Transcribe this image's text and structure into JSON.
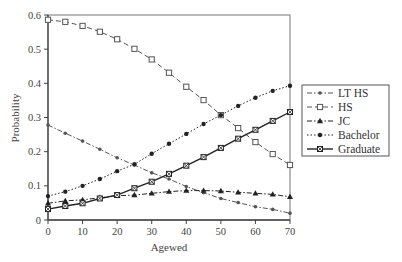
{
  "chart_data": {
    "type": "line",
    "title": "",
    "xlabel": "Agewed",
    "ylabel": "Probability",
    "xlim": [
      0,
      70
    ],
    "ylim": [
      0,
      0.6
    ],
    "xticks": [
      0,
      10,
      20,
      30,
      40,
      50,
      60,
      70
    ],
    "yticks": [
      0,
      0.1,
      0.2,
      0.3,
      0.4,
      0.5,
      0.6
    ],
    "ytick_labels": [
      "0",
      "0.1",
      "0.2",
      "0.3",
      "0.4",
      "0.5",
      "0.6"
    ],
    "grid": false,
    "legend_position": "right-outside",
    "x": [
      0,
      5,
      10,
      15,
      20,
      25,
      30,
      35,
      40,
      45,
      50,
      55,
      60,
      65,
      70
    ],
    "series": [
      {
        "name": "LT HS",
        "marker": "circle-small",
        "line": "dash-dot",
        "color": "#555555",
        "values": [
          0.278,
          0.254,
          0.231,
          0.207,
          0.182,
          0.161,
          0.138,
          0.12,
          0.098,
          0.08,
          0.063,
          0.051,
          0.039,
          0.031,
          0.02
        ]
      },
      {
        "name": "HS",
        "marker": "square-open",
        "line": "dashed",
        "color": "#555555",
        "values": [
          0.586,
          0.58,
          0.568,
          0.551,
          0.529,
          0.501,
          0.47,
          0.431,
          0.39,
          0.351,
          0.307,
          0.269,
          0.228,
          0.193,
          0.161
        ]
      },
      {
        "name": "JC",
        "marker": "triangle-filled",
        "line": "dash-dot",
        "color": "#222222",
        "values": [
          0.049,
          0.056,
          0.059,
          0.065,
          0.071,
          0.073,
          0.078,
          0.083,
          0.086,
          0.086,
          0.085,
          0.081,
          0.078,
          0.075,
          0.068
        ]
      },
      {
        "name": "Bachelor",
        "marker": "circle-filled",
        "line": "dotted",
        "color": "#222222",
        "values": [
          0.07,
          0.083,
          0.1,
          0.12,
          0.143,
          0.163,
          0.194,
          0.223,
          0.252,
          0.281,
          0.307,
          0.334,
          0.358,
          0.378,
          0.393
        ]
      },
      {
        "name": "Graduate",
        "marker": "square-x",
        "line": "solid",
        "color": "#222222",
        "values": [
          0.032,
          0.041,
          0.049,
          0.063,
          0.073,
          0.093,
          0.112,
          0.135,
          0.159,
          0.184,
          0.211,
          0.238,
          0.264,
          0.29,
          0.316
        ]
      }
    ]
  }
}
